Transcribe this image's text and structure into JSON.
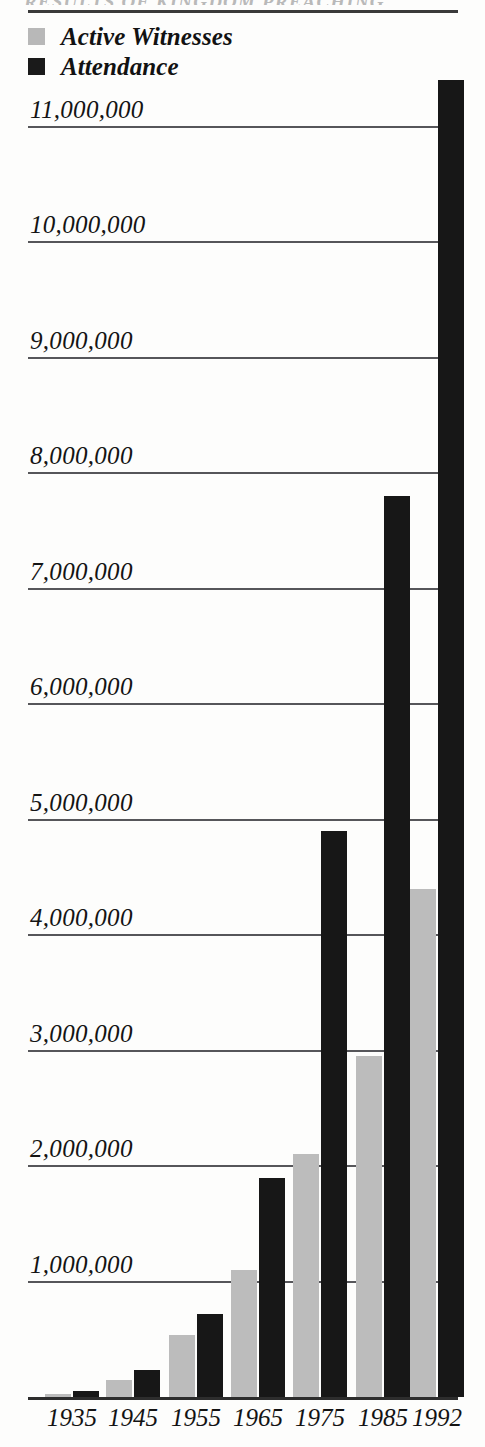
{
  "title_ghost": "RESULTS OF KINGDOM PREACHING",
  "legend": {
    "position": "top-left",
    "items": [
      {
        "label": "Active Witnesses",
        "color": "#b8b8b8",
        "swatch": "legend-swatch-gray"
      },
      {
        "label": "Attendance",
        "color": "#1a1a1a",
        "swatch": "legend-swatch-dark"
      }
    ]
  },
  "axis": {
    "y_tick_labels": [
      "11,000,000",
      "10,000,000",
      "9,000,000",
      "8,000,000",
      "7,000,000",
      "6,000,000",
      "5,000,000",
      "4,000,000",
      "3,000,000",
      "2,000,000",
      "1,000,000"
    ],
    "x_tick_labels": [
      "1935",
      "1945",
      "1955",
      "1965",
      "1975",
      "1985",
      "1992"
    ]
  },
  "chart_data": {
    "type": "bar",
    "title": "RESULTS OF KINGDOM PREACHING",
    "xlabel": "",
    "ylabel": "",
    "grid": true,
    "legend_position": "top-left",
    "categories": [
      "1935",
      "1945",
      "1955",
      "1965",
      "1975",
      "1985",
      "1992"
    ],
    "ylim": [
      0,
      11500000
    ],
    "ytick_values": [
      1000000,
      2000000,
      3000000,
      4000000,
      5000000,
      6000000,
      7000000,
      8000000,
      9000000,
      10000000,
      11000000
    ],
    "series": [
      {
        "name": "Active Witnesses",
        "color": "#b8b8b8",
        "values": [
          30000,
          150000,
          540000,
          1100000,
          2100000,
          2950000,
          4400000
        ]
      },
      {
        "name": "Attendance",
        "color": "#1a1a1a",
        "values": [
          50000,
          230000,
          720000,
          1900000,
          4900000,
          7800000,
          11400000
        ]
      }
    ]
  },
  "geometry": {
    "baseline_y": 1397,
    "px_per_unit": 0.0001155,
    "plot_left": 28,
    "plot_right": 458,
    "group_centers": [
      72,
      133,
      196,
      258,
      320,
      383,
      437
    ],
    "bar_width": 26,
    "bar_gap": 2
  }
}
